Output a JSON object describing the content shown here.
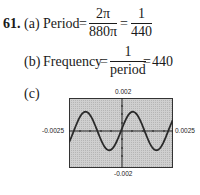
{
  "problem": {
    "number": "61.",
    "part_a": {
      "label": "(a)",
      "lhs": "Period",
      "eq1": "=",
      "frac1_num": "2π",
      "frac1_den": "880π",
      "eq2": "=",
      "frac2_num": "1",
      "frac2_den": "440"
    },
    "part_b": {
      "label": "(b)",
      "lhs": "Frequency",
      "eq1": "=",
      "frac_num": "1",
      "frac_den": "period",
      "eq2": "=",
      "result": "440"
    },
    "part_c": {
      "label": "(c)"
    }
  },
  "chart_data": {
    "type": "line",
    "title": "",
    "function": "sin(880πx) scaled",
    "xlim": [
      -0.0025,
      0.0025
    ],
    "ylim": [
      -0.002,
      0.002
    ],
    "tick_labels": {
      "top": "0.002",
      "bottom": "-0.002",
      "left": "-0.0025",
      "right": "0.0025"
    },
    "period": 0.00227,
    "amplitude_approx": 0.0011,
    "background": "#c8c8c8",
    "curve_color": "#2a2a2a",
    "grid": false
  }
}
